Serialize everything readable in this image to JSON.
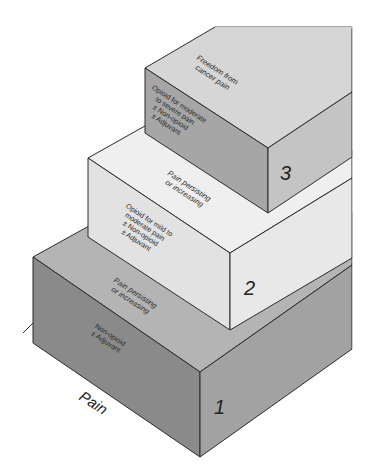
{
  "diagram": {
    "type": "stepped-pyramid",
    "axis_label": "Pain",
    "colors": {
      "step1_front": "#8a8a8a",
      "step1_top": "#b4b4b4",
      "step1_right": "#a2a2a2",
      "step2_front": "#e2e2e2",
      "step2_top": "#efefef",
      "step2_right": "#e8e8e8",
      "step3_front": "#a6a6a6",
      "step3_top": "#d6d6d6",
      "step3_right": "#c4c4c4",
      "edge": "#2b2b2b"
    },
    "steps": [
      {
        "number": "1",
        "treatment_lines": [
          "Non-opioid",
          "± Adjuvant"
        ],
        "transition_lines": [
          "Pain persisting",
          "or increasing"
        ]
      },
      {
        "number": "2",
        "treatment_lines": [
          "Opioid for mild to",
          "moderate pain",
          "± Non-opioid",
          "± Adjuvant"
        ],
        "transition_lines": [
          "Pain persisting",
          "or increasing"
        ]
      },
      {
        "number": "3",
        "treatment_lines": [
          "Opioid for moderate",
          "to severe pain",
          "± Non-opioid",
          "± Adjuvant"
        ],
        "transition_lines": [
          "Freedom from",
          "cancer pain"
        ]
      }
    ]
  }
}
